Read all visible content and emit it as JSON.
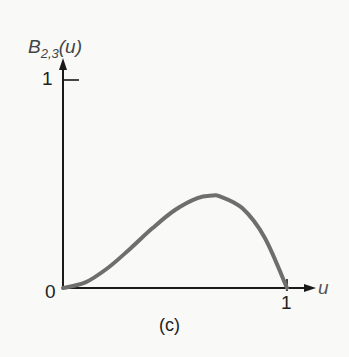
{
  "chart_data": {
    "type": "line",
    "title": "",
    "caption": "(c)",
    "ylabel": "B_{2,3}(u)",
    "ylabel_main": "B",
    "ylabel_sub": "2,3",
    "ylabel_arg": "(u)",
    "xlabel": "u",
    "xlim": [
      0,
      1
    ],
    "ylim": [
      0,
      1
    ],
    "x_ticks": [
      "0",
      "1"
    ],
    "y_ticks": [
      "1"
    ],
    "grid": false,
    "legend": null,
    "series": [
      {
        "name": "B_{2,3}(u)",
        "color": "#6e6e6e",
        "x": [
          0,
          0.1,
          0.2,
          0.3,
          0.4,
          0.5,
          0.6,
          0.667,
          0.7,
          0.8,
          0.9,
          1.0
        ],
        "y": [
          0,
          0.027,
          0.096,
          0.189,
          0.288,
          0.375,
          0.432,
          0.444,
          0.441,
          0.384,
          0.243,
          0
        ]
      }
    ]
  },
  "labels": {
    "origin": "0",
    "y_tick_1": "1",
    "x_tick_1": "1",
    "x_axis": "u",
    "caption": "(c)"
  }
}
